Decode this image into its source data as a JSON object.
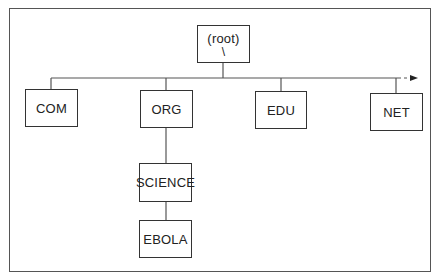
{
  "diagram": {
    "type": "tree",
    "root": {
      "label": "(root)",
      "sublabel": "\\"
    },
    "top_level": [
      {
        "label": "COM"
      },
      {
        "label": "ORG"
      },
      {
        "label": "EDU"
      },
      {
        "label": "NET"
      }
    ],
    "org_children": [
      {
        "label": "SCIENCE"
      }
    ],
    "science_children": [
      {
        "label": "EBOLA"
      }
    ],
    "continuation": "dashed-arrow-right",
    "colors": {
      "line": "#555555",
      "box_border": "#333333",
      "text": "#222222",
      "background": "#ffffff"
    }
  }
}
